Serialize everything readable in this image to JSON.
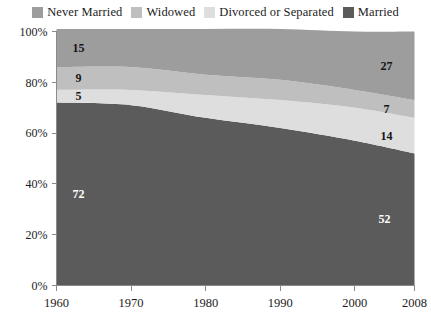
{
  "legend": {
    "position": "top",
    "items": [
      {
        "label": "Never Married",
        "color": "#9d9d9d",
        "swatch_name": "legend-swatch-never-married"
      },
      {
        "label": "Widowed",
        "color": "#bfbfbf",
        "swatch_name": "legend-swatch-widowed"
      },
      {
        "label": "Divorced or Separated",
        "color": "#dedede",
        "swatch_name": "legend-swatch-divorced-or-separated"
      },
      {
        "label": "Married",
        "color": "#5b5b5b",
        "swatch_name": "legend-swatch-married"
      }
    ]
  },
  "axes": {
    "y_ticks": [
      "0%",
      "20%",
      "40%",
      "60%",
      "80%",
      "100%"
    ],
    "x_ticks": [
      "1960",
      "1970",
      "1980",
      "1990",
      "2000",
      "2008"
    ]
  },
  "annotations": {
    "left": [
      {
        "text": "15",
        "series": "Never Married",
        "style": "dark"
      },
      {
        "text": "9",
        "series": "Widowed",
        "style": "dark"
      },
      {
        "text": "5",
        "series": "Divorced or Separated",
        "style": "dark"
      },
      {
        "text": "72",
        "series": "Married",
        "style": "light"
      }
    ],
    "right": [
      {
        "text": "27",
        "series": "Never Married",
        "style": "dark"
      },
      {
        "text": "7",
        "series": "Widowed",
        "style": "dark"
      },
      {
        "text": "14",
        "series": "Divorced or Separated",
        "style": "dark"
      },
      {
        "text": "52",
        "series": "Married",
        "style": "light"
      }
    ]
  },
  "chart_data": {
    "type": "area",
    "stacked": true,
    "stack_total": 100,
    "title": "",
    "subtitle": "",
    "xlabel": "",
    "ylabel": "",
    "xlim": [
      1960,
      2008
    ],
    "ylim": [
      0,
      100
    ],
    "grid": false,
    "legend_position": "top",
    "x": [
      1960,
      1970,
      1980,
      1990,
      2000,
      2008
    ],
    "x_tick_labels": [
      "1960",
      "1970",
      "1980",
      "1990",
      "2000",
      "2008"
    ],
    "y_tick_values": [
      0,
      20,
      40,
      60,
      80,
      100
    ],
    "y_tick_labels": [
      "0%",
      "20%",
      "40%",
      "60%",
      "80%",
      "100%"
    ],
    "stack_order_bottom_to_top": [
      "Married",
      "Divorced or Separated",
      "Widowed",
      "Never Married"
    ],
    "series": [
      {
        "name": "Married",
        "color": "#5b5b5b",
        "values": [
          72,
          71,
          66,
          62,
          57,
          52
        ],
        "label_start": 72,
        "label_end": 52
      },
      {
        "name": "Divorced or Separated",
        "color": "#dedede",
        "values": [
          5,
          6,
          9,
          11,
          13,
          14
        ],
        "label_start": 5,
        "label_end": 14
      },
      {
        "name": "Widowed",
        "color": "#bfbfbf",
        "values": [
          9,
          9,
          8,
          8,
          7,
          7
        ],
        "label_start": 9,
        "label_end": 7
      },
      {
        "name": "Never Married",
        "color": "#9d9d9d",
        "values": [
          15,
          15,
          18,
          20,
          23,
          27
        ],
        "label_start": 15,
        "label_end": 27
      }
    ]
  }
}
